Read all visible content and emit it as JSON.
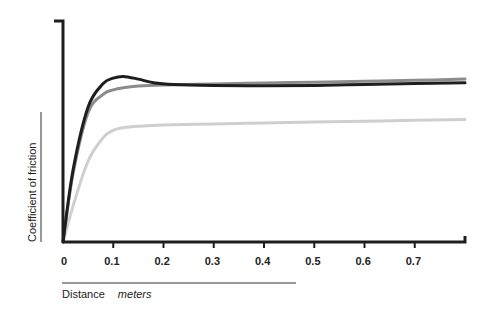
{
  "chart_data": {
    "type": "line",
    "title": "",
    "xlabel": "Distance",
    "xlabel_unit": "meters",
    "ylabel": "Coefficient of friction",
    "xlim": [
      0,
      0.8
    ],
    "ylim": [
      0,
      1
    ],
    "x_ticks": [
      "0",
      "0.1",
      "0.2",
      "0.3",
      "0.4",
      "0.5",
      "0.6",
      "0.7"
    ],
    "y_ticks": [],
    "grid": false,
    "legend": null,
    "series": [
      {
        "name": "black curve",
        "color": "#1e1e1e",
        "x": [
          0,
          0.02,
          0.05,
          0.08,
          0.1,
          0.12,
          0.15,
          0.18,
          0.22,
          0.3,
          0.4,
          0.5,
          0.6,
          0.7,
          0.8
        ],
        "y": [
          0,
          0.4,
          0.75,
          0.88,
          0.91,
          0.92,
          0.905,
          0.885,
          0.875,
          0.87,
          0.868,
          0.87,
          0.875,
          0.88,
          0.885
        ]
      },
      {
        "name": "dark gray curve",
        "color": "#8c8c8c",
        "x": [
          0,
          0.02,
          0.05,
          0.08,
          0.1,
          0.12,
          0.15,
          0.2,
          0.3,
          0.4,
          0.5,
          0.6,
          0.7,
          0.8
        ],
        "y": [
          0,
          0.38,
          0.72,
          0.82,
          0.845,
          0.857,
          0.866,
          0.872,
          0.878,
          0.883,
          0.888,
          0.893,
          0.898,
          0.905
        ]
      },
      {
        "name": "light gray curve",
        "color": "#cfcfcf",
        "x": [
          0,
          0.02,
          0.05,
          0.08,
          0.1,
          0.12,
          0.15,
          0.2,
          0.3,
          0.4,
          0.5,
          0.6,
          0.7,
          0.8
        ],
        "y": [
          0,
          0.2,
          0.45,
          0.58,
          0.62,
          0.635,
          0.643,
          0.65,
          0.656,
          0.661,
          0.666,
          0.671,
          0.676,
          0.68
        ]
      }
    ]
  }
}
